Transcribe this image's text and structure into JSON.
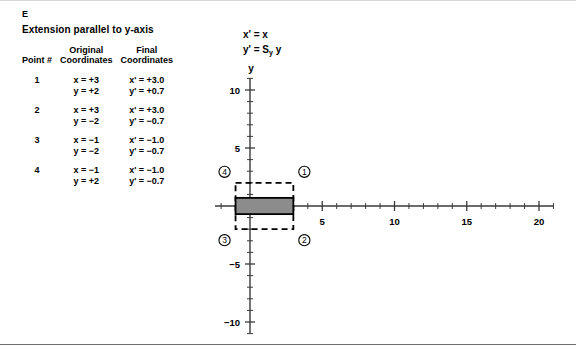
{
  "panel": {
    "letter": "E",
    "title": "Extension parallel to y-axis"
  },
  "equations": {
    "line1": "x' = x",
    "line2_prefix": "y' = S",
    "line2_sub": "y",
    "line2_suffix": " y"
  },
  "table": {
    "headers": {
      "point": "Point #",
      "original_top": "Original",
      "original_bottom": "Coordinates",
      "final_top": "Final",
      "final_bottom": "Coordinates"
    },
    "rows": [
      {
        "point": "1",
        "orig_x": "x = +3",
        "orig_y": "y = +2",
        "final_x": "x' = +3.0",
        "final_y": "y' = +0.7"
      },
      {
        "point": "2",
        "orig_x": "x = +3",
        "orig_y": "y = −2",
        "final_x": "x' = +3.0",
        "final_y": "y' = −0.7"
      },
      {
        "point": "3",
        "orig_x": "x = −1",
        "orig_y": "y = −2",
        "final_x": "x' = −1.0",
        "final_y": "y' = −0.7"
      },
      {
        "point": "4",
        "orig_x": "x = −1",
        "orig_y": "y = +2",
        "final_x": "x' = −1.0",
        "final_y": "y' = −0.7"
      }
    ]
  },
  "chart_data": {
    "type": "scatter",
    "title": "Extension parallel to y-axis",
    "xlabel": "x",
    "ylabel": "y",
    "xlim": [
      -6,
      21
    ],
    "ylim": [
      -11,
      11
    ],
    "xticks_major": [
      -5,
      5,
      10,
      15,
      20
    ],
    "xtick_labels": [
      "−5",
      "5",
      "10",
      "15",
      "20"
    ],
    "yticks_major": [
      -10,
      -5,
      5,
      10
    ],
    "ytick_labels": [
      "−10",
      "−5",
      "5",
      "10"
    ],
    "tick_step": 1,
    "grid": false,
    "legend": "none",
    "shapes": [
      {
        "name": "original-rectangle",
        "style": "dashed",
        "x_min": -1,
        "x_max": 3,
        "y_min": -2,
        "y_max": 2,
        "fill": "none",
        "stroke": "#000000"
      },
      {
        "name": "transformed-rectangle",
        "style": "solid",
        "x_min": -1,
        "x_max": 3,
        "y_min": -0.7,
        "y_max": 0.7,
        "fill": "#8c8c8c",
        "stroke": "#000000"
      }
    ],
    "points": [
      {
        "label": "1",
        "x": 3,
        "y": 2,
        "xp": 3.0,
        "yp": 0.7
      },
      {
        "label": "2",
        "x": 3,
        "y": -2,
        "xp": 3.0,
        "yp": -0.7
      },
      {
        "label": "3",
        "x": -1,
        "y": -2,
        "xp": -1.0,
        "yp": -0.7
      },
      {
        "label": "4",
        "x": -1,
        "y": 2,
        "xp": -1.0,
        "yp": -0.7
      }
    ],
    "point_markers": [
      {
        "label": "1",
        "x": 3.0,
        "y": 2.0
      },
      {
        "label": "2",
        "x": 3.0,
        "y": -2.0
      },
      {
        "label": "3",
        "x": -1.0,
        "y": -2.0
      },
      {
        "label": "4",
        "x": -1.0,
        "y": 2.0
      }
    ],
    "colors": {
      "axis": "#3a3a3a",
      "shade": "#8c8c8c",
      "stroke": "#000000",
      "rule": "#6f6f6f"
    }
  }
}
